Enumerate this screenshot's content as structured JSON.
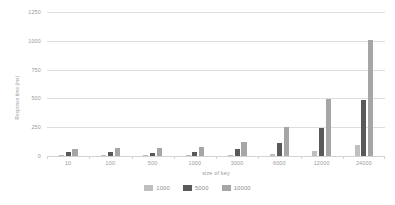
{
  "chart_data": {
    "type": "bar",
    "title": "",
    "xlabel": "size of key",
    "ylabel": "Response time (ms)",
    "categories": [
      "10",
      "100",
      "500",
      "1000",
      "3000",
      "6000",
      "12000",
      "24000"
    ],
    "series": [
      {
        "name": "1000",
        "color": "#bfbfbf",
        "values": [
          4,
          5,
          6,
          8,
          10,
          18,
          42,
          95
        ]
      },
      {
        "name": "5000",
        "color": "#595959",
        "values": [
          38,
          32,
          30,
          35,
          58,
          112,
          240,
          485
        ]
      },
      {
        "name": "10000",
        "color": "#a6a6a6",
        "values": [
          62,
          70,
          72,
          74,
          120,
          248,
          492,
          1005
        ]
      }
    ],
    "ylim": [
      0,
      1250
    ],
    "yticks": [
      "0",
      "250",
      "500",
      "750",
      "1000",
      "1250"
    ],
    "ytick_values": [
      0,
      250,
      500,
      750,
      1000,
      1250
    ],
    "grid": true,
    "legend_position": "bottom",
    "gridline_color": "#dedede",
    "axis_text_color": "#9a9a9a",
    "background": "#ffffff"
  }
}
